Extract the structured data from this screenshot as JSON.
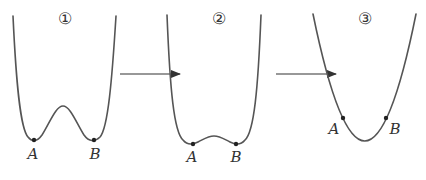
{
  "diagram": {
    "panels": [
      {
        "number_label": "①",
        "point_a_label": "A",
        "point_b_label": "B",
        "shape": "double-well with high barrier"
      },
      {
        "number_label": "②",
        "point_a_label": "A",
        "point_b_label": "B",
        "shape": "double-well with low barrier"
      },
      {
        "number_label": "③",
        "point_a_label": "A",
        "point_b_label": "B",
        "shape": "single parabola well"
      }
    ],
    "arrows": [
      {
        "from": "①",
        "to": "②"
      },
      {
        "from": "②",
        "to": "③"
      }
    ],
    "colors": {
      "curve": "#555555",
      "arrow": "#333333",
      "point": "#222222",
      "background": "#ffffff"
    }
  }
}
